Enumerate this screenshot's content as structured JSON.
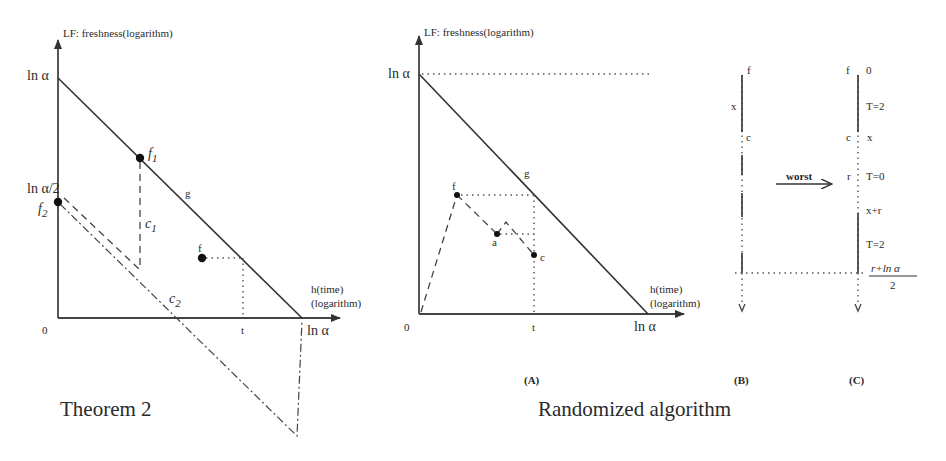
{
  "left_panel": {
    "y_axis_label": "LF: freshness(logarithm)",
    "y_tick_top": "ln α",
    "y_tick_half": "ln α/2",
    "f1": {
      "base": "f",
      "sub": "1"
    },
    "f2": {
      "base": "f",
      "sub": "2"
    },
    "g_label": "g",
    "c1": {
      "base": "c",
      "sub": "1"
    },
    "c2": {
      "base": "c",
      "sub": "2"
    },
    "f_label": "f",
    "origin": "0",
    "t_label": "t",
    "x_tick_end": "ln α",
    "x_axis_label_1": "h(time)",
    "x_axis_label_2": "(logarithm)",
    "caption": "Theorem 2"
  },
  "middle_panel": {
    "y_axis_label": "LF: freshness(logarithm)",
    "y_tick_top": "ln α",
    "g_label": "g",
    "f_label": "f",
    "a_label": "a",
    "c_label": "c",
    "origin": "0",
    "t_label": "t",
    "x_tick_end": "ln α",
    "x_axis_label_1": "h(time)",
    "x_axis_label_2": "(logarithm)",
    "sub_caption": "(A)",
    "caption": "Randomized algorithm"
  },
  "right_panel": {
    "b": {
      "f_label": "f",
      "x_label": "x",
      "c_label": "c",
      "sub_caption": "(B)"
    },
    "arrow_label": "worst",
    "c": {
      "f_label": "f",
      "zero_label": "0",
      "t2_top": "T=2",
      "c_label": "c",
      "x_label": "x",
      "r_label": "r",
      "t0_label": "T=0",
      "xr_label": "x+r",
      "t2_bottom": "T=2",
      "fraction_numerator": "r+ln α",
      "fraction_denominator": "2",
      "sub_caption": "(C)"
    }
  }
}
